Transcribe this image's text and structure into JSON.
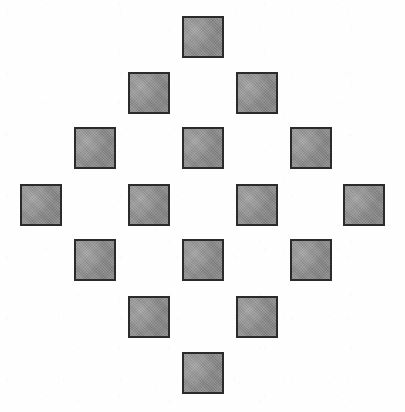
{
  "figure": {
    "canvas": {
      "width": 405,
      "height": 412,
      "background_color": "#ffffff"
    },
    "style": {
      "square_fill_color": "#8e8e8e",
      "square_border_color": "#2b2b2b",
      "square_border_width": 2,
      "square_width": 42,
      "square_height": 42,
      "column_pitch": 54,
      "row_pitch": 56,
      "texture": "dithered-halftone-scan"
    },
    "layout": {
      "pattern": "diamond",
      "total_squares": 16,
      "row_count": 7,
      "column_count": 7,
      "squares_per_row": [
        1,
        2,
        3,
        4,
        3,
        2,
        1
      ],
      "symmetry": "four-fold (horizontal and vertical mirror)"
    },
    "rows": [
      {
        "index": 1,
        "count": 1,
        "y": 16,
        "squares": [
          {
            "id": "r1c4",
            "row": 1,
            "col": 4,
            "x": 182,
            "y": 16,
            "w": 42,
            "h": 42,
            "label": "top apex"
          }
        ]
      },
      {
        "index": 2,
        "count": 2,
        "y": 72,
        "squares": [
          {
            "id": "r2c3",
            "row": 2,
            "col": 3,
            "x": 128,
            "y": 72,
            "w": 42,
            "h": 42,
            "label": "upper left"
          },
          {
            "id": "r2c5",
            "row": 2,
            "col": 5,
            "x": 236,
            "y": 72,
            "w": 42,
            "h": 42,
            "label": "upper right"
          }
        ]
      },
      {
        "index": 3,
        "count": 3,
        "y": 127,
        "squares": [
          {
            "id": "r3c2",
            "row": 3,
            "col": 2,
            "x": 74,
            "y": 127,
            "w": 42,
            "h": 42,
            "label": "left"
          },
          {
            "id": "r3c4",
            "row": 3,
            "col": 4,
            "x": 182,
            "y": 127,
            "w": 42,
            "h": 42,
            "label": "center"
          },
          {
            "id": "r3c6",
            "row": 3,
            "col": 6,
            "x": 290,
            "y": 127,
            "w": 42,
            "h": 42,
            "label": "right"
          }
        ]
      },
      {
        "index": 4,
        "count": 4,
        "y": 184,
        "squares": [
          {
            "id": "r4c1",
            "row": 4,
            "col": 1,
            "x": 20,
            "y": 184,
            "w": 42,
            "h": 42,
            "label": "far left apex"
          },
          {
            "id": "r4c3",
            "row": 4,
            "col": 3,
            "x": 128,
            "y": 184,
            "w": 42,
            "h": 42,
            "label": "center left"
          },
          {
            "id": "r4c5",
            "row": 4,
            "col": 5,
            "x": 236,
            "y": 184,
            "w": 42,
            "h": 42,
            "label": "center right"
          },
          {
            "id": "r4c7",
            "row": 4,
            "col": 7,
            "x": 343,
            "y": 184,
            "w": 42,
            "h": 42,
            "label": "far right apex"
          }
        ]
      },
      {
        "index": 5,
        "count": 3,
        "y": 239,
        "squares": [
          {
            "id": "r5c2",
            "row": 5,
            "col": 2,
            "x": 74,
            "y": 239,
            "w": 42,
            "h": 42,
            "label": "left"
          },
          {
            "id": "r5c4",
            "row": 5,
            "col": 4,
            "x": 182,
            "y": 239,
            "w": 42,
            "h": 42,
            "label": "center"
          },
          {
            "id": "r5c6",
            "row": 5,
            "col": 6,
            "x": 290,
            "y": 239,
            "w": 42,
            "h": 42,
            "label": "right"
          }
        ]
      },
      {
        "index": 6,
        "count": 2,
        "y": 296,
        "squares": [
          {
            "id": "r6c3",
            "row": 6,
            "col": 3,
            "x": 128,
            "y": 296,
            "w": 42,
            "h": 42,
            "label": "lower left"
          },
          {
            "id": "r6c5",
            "row": 6,
            "col": 5,
            "x": 236,
            "y": 296,
            "w": 42,
            "h": 42,
            "label": "lower right"
          }
        ]
      },
      {
        "index": 7,
        "count": 1,
        "y": 352,
        "squares": [
          {
            "id": "r7c4",
            "row": 7,
            "col": 4,
            "x": 182,
            "y": 352,
            "w": 42,
            "h": 42,
            "label": "bottom apex"
          }
        ]
      }
    ]
  }
}
